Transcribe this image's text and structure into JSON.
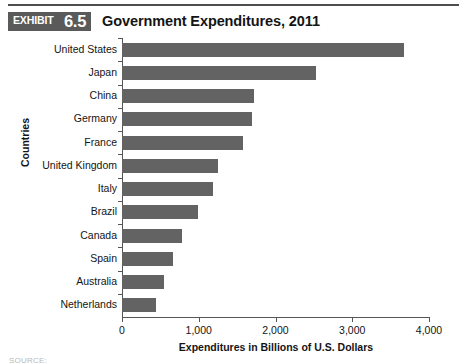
{
  "header": {
    "rule": "divider",
    "exhibit_word": "EXHIBIT",
    "exhibit_number": "6.5",
    "title": "Government Expenditures, 2011"
  },
  "footer": {
    "source_note": "SOURCE:"
  },
  "chart_data": {
    "type": "bar",
    "orientation": "horizontal",
    "title": "Government Expenditures, 2011",
    "xlabel": "Expenditures in Billions of U.S. Dollars",
    "ylabel": "Countries",
    "xlim": [
      0,
      4000
    ],
    "xticks": [
      0,
      1000,
      2000,
      3000,
      4000
    ],
    "xtick_labels": [
      "0",
      "1,000",
      "2,000",
      "3,000",
      "4,000"
    ],
    "grid": false,
    "legend": false,
    "bar_color": "#636363",
    "axis_color": "#555555",
    "categories": [
      "United States",
      "Japan",
      "China",
      "Germany",
      "France",
      "United Kingdom",
      "Italy",
      "Brazil",
      "Canada",
      "Spain",
      "Australia",
      "Netherlands"
    ],
    "values": [
      3680,
      2530,
      1720,
      1700,
      1580,
      1250,
      1190,
      990,
      780,
      665,
      545,
      440
    ]
  }
}
